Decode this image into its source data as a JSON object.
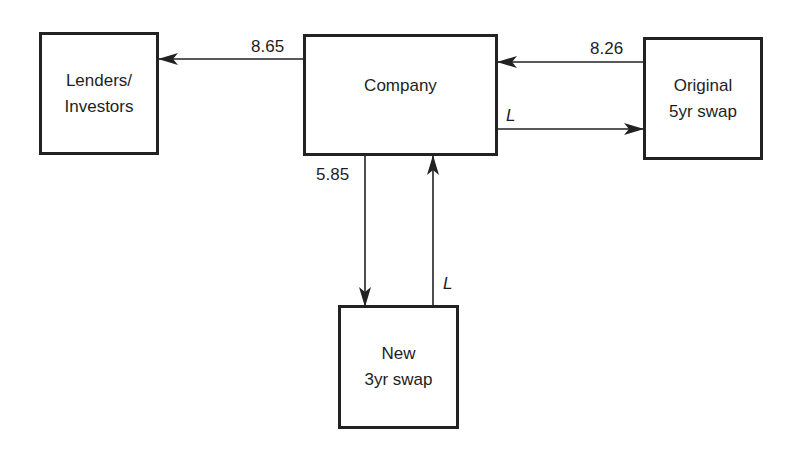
{
  "diagram": {
    "type": "flow-diagram",
    "colors": {
      "stroke": "#222222",
      "text": "#1e1e1e",
      "background": "#ffffff"
    },
    "nodes": [
      {
        "id": "lenders",
        "label": "Lenders/\nInvestors"
      },
      {
        "id": "company",
        "label": "Company"
      },
      {
        "id": "original_swap",
        "label": "Original\n5yr swap"
      },
      {
        "id": "new_swap",
        "label": "New\n3yr swap"
      }
    ],
    "edges": [
      {
        "from": "company",
        "to": "lenders",
        "label": "8.65"
      },
      {
        "from": "original_swap",
        "to": "company",
        "label": "8.26"
      },
      {
        "from": "company",
        "to": "original_swap",
        "label": "L"
      },
      {
        "from": "company",
        "to": "new_swap",
        "label": "5.85"
      },
      {
        "from": "new_swap",
        "to": "company",
        "label": "L"
      }
    ]
  }
}
